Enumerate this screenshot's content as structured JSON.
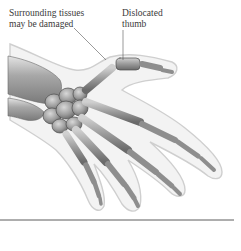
{
  "diagram": {
    "labels": [
      {
        "id": "surrounding-tissues",
        "lines": [
          "Surrounding tissues",
          "may be damaged"
        ]
      },
      {
        "id": "dislocated-thumb",
        "lines": [
          "Dislocated",
          "thumb"
        ]
      }
    ],
    "colors": {
      "bone_fill": "#9a9a9a",
      "bone_dark": "#5a5a5a",
      "bone_light": "#d6d6d6",
      "skin_fill": "#f2f2f2",
      "skin_outline": "#c8c8c8",
      "leader_line": "#555555",
      "baseline": "#333333",
      "label_text": "#3a3a3a"
    }
  }
}
